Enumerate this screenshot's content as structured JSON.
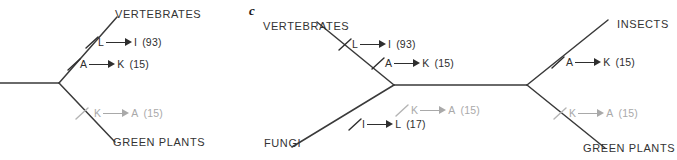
{
  "figure": {
    "panel_letter": "c",
    "width": 677,
    "height": 160,
    "colors": {
      "branch": "#3a3a3a",
      "text": "#2e2e2e",
      "faded": "#a9a9a9",
      "background": "#ffffff"
    }
  },
  "panels": [
    {
      "id": "left-tree",
      "name": "partial-tree-left",
      "taxa": [
        {
          "label": "VERTEBRATES",
          "position": "top-right"
        },
        {
          "label": "GREEN PLANTS",
          "position": "bottom-right"
        }
      ],
      "substitutions": [
        {
          "from": "L",
          "to": "I",
          "count": "(93)",
          "branch": "vertebrates-upper",
          "faded": false
        },
        {
          "from": "A",
          "to": "K",
          "count": "(15)",
          "branch": "vertebrates-lower",
          "faded": false
        },
        {
          "from": "K",
          "to": "A",
          "count": "(15)",
          "branch": "green-plants",
          "faded": true
        }
      ]
    },
    {
      "id": "right-tree",
      "name": "unrooted-tree-right",
      "taxa": [
        {
          "label": "VERTEBRATES",
          "position": "top-left"
        },
        {
          "label": "FUNGI",
          "position": "bottom-left"
        },
        {
          "label": "INSECTS",
          "position": "top-right"
        },
        {
          "label": "GREEN PLANTS",
          "position": "bottom-right"
        }
      ],
      "substitutions": [
        {
          "from": "L",
          "to": "I",
          "count": "(93)",
          "branch": "vertebrates-upper",
          "faded": false
        },
        {
          "from": "A",
          "to": "K",
          "count": "(15)",
          "branch": "vertebrates-lower",
          "faded": false
        },
        {
          "from": "K",
          "to": "A",
          "count": "(15)",
          "branch": "fungi-upper",
          "faded": true
        },
        {
          "from": "I",
          "to": "L",
          "count": "(17)",
          "branch": "fungi-lower",
          "faded": false
        },
        {
          "from": "A",
          "to": "K",
          "count": "(15)",
          "branch": "insects",
          "faded": false
        },
        {
          "from": "K",
          "to": "A",
          "count": "(15)",
          "branch": "green-plants",
          "faded": true
        }
      ]
    }
  ],
  "labels": {
    "left": {
      "taxon_top": "VERTEBRATES",
      "taxon_bottom": "GREEN PLANTS",
      "sub1": {
        "from": "L",
        "to": "I",
        "count": "(93)"
      },
      "sub2": {
        "from": "A",
        "to": "K",
        "count": "(15)"
      },
      "sub3": {
        "from": "K",
        "to": "A",
        "count": "(15)"
      }
    },
    "right": {
      "panel": "c",
      "taxon_top_left": "VERTEBRATES",
      "taxon_bottom_left": "FUNGI",
      "taxon_top_right": "INSECTS",
      "taxon_bottom_right": "GREEN PLANTS",
      "sub1": {
        "from": "L",
        "to": "I",
        "count": "(93)"
      },
      "sub2": {
        "from": "A",
        "to": "K",
        "count": "(15)"
      },
      "sub3": {
        "from": "K",
        "to": "A",
        "count": "(15)"
      },
      "sub4": {
        "from": "I",
        "to": "L",
        "count": "(17)"
      },
      "sub5": {
        "from": "A",
        "to": "K",
        "count": "(15)"
      },
      "sub6": {
        "from": "K",
        "to": "A",
        "count": "(15)"
      }
    }
  }
}
